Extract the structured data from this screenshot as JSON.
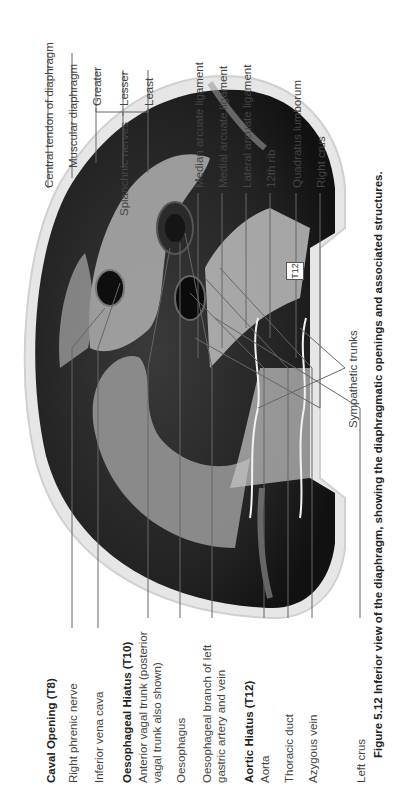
{
  "figure": {
    "orientation": "rotated-90-ccw",
    "caption": {
      "number": "Figure 5.12",
      "text": "Inferior view of the diaphragm, showing the diaphragmatic openings and associated structures."
    },
    "vertebra_marker": "T12",
    "left_labels": [
      {
        "id": "central-tendon",
        "text": "Central tendon of diaphragm"
      },
      {
        "id": "muscular-diaphragm",
        "text": "Muscular diaphragm"
      },
      {
        "id": "splanchnic-nerves",
        "text": "Splanchnic nerves"
      },
      {
        "id": "greater",
        "text": "Greater"
      },
      {
        "id": "lesser",
        "text": "Lesser"
      },
      {
        "id": "least",
        "text": "Least"
      },
      {
        "id": "median-arcuate",
        "text": "Median arcuate ligament"
      },
      {
        "id": "medial-arcuate",
        "text": "Medial arcuate ligament"
      },
      {
        "id": "lateral-arcuate",
        "text": "Lateral arcuate ligament"
      },
      {
        "id": "12th-rib",
        "text": "12th rib"
      },
      {
        "id": "quadratus-lumborum",
        "text": "Quadratus lumborum"
      },
      {
        "id": "right-crus",
        "text": "Right crus"
      }
    ],
    "right_labels": [
      {
        "id": "caval-opening",
        "text": "Caval Opening (T8)",
        "heading": true
      },
      {
        "id": "right-phrenic",
        "text": "Right phrenic nerve"
      },
      {
        "id": "ivc",
        "text": "Inferior vena cava"
      },
      {
        "id": "oesophageal-hiatus",
        "text": "Oesophageal Hiatus (T10)",
        "heading": true
      },
      {
        "id": "anterior-vagal",
        "text": "Anterior vagal trunk (posterior vagal trunk also shown)"
      },
      {
        "id": "oesophagus",
        "text": "Oesophagus"
      },
      {
        "id": "oesophageal-branch",
        "text": "Oesophageal branch of left gastric artery and vein"
      },
      {
        "id": "aortic-hiatus",
        "text": "Aortic Hiatus (T12)",
        "heading": true
      },
      {
        "id": "aorta",
        "text": "Aorta"
      },
      {
        "id": "thoracic-duct",
        "text": "Thoracic duct"
      },
      {
        "id": "azygous-vein",
        "text": "Azygous vein"
      },
      {
        "id": "left-crus",
        "text": "Left crus"
      }
    ],
    "bottom_labels": [
      {
        "id": "sympathetic-trunks",
        "text": "Sympathetic trunks"
      }
    ]
  }
}
